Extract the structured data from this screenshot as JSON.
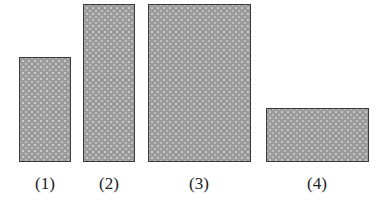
{
  "figure": {
    "shapes": [
      {
        "label": "(1)",
        "x": 19,
        "y": 57,
        "w": 52,
        "h": 105
      },
      {
        "label": "(2)",
        "x": 83,
        "y": 4,
        "w": 52,
        "h": 158
      },
      {
        "label": "(3)",
        "x": 148,
        "y": 4,
        "w": 103,
        "h": 158
      },
      {
        "label": "(4)",
        "x": 266,
        "y": 108,
        "w": 103,
        "h": 54
      }
    ],
    "fill_color": "#9a9a9a",
    "border_color": "#3a3a3a"
  }
}
